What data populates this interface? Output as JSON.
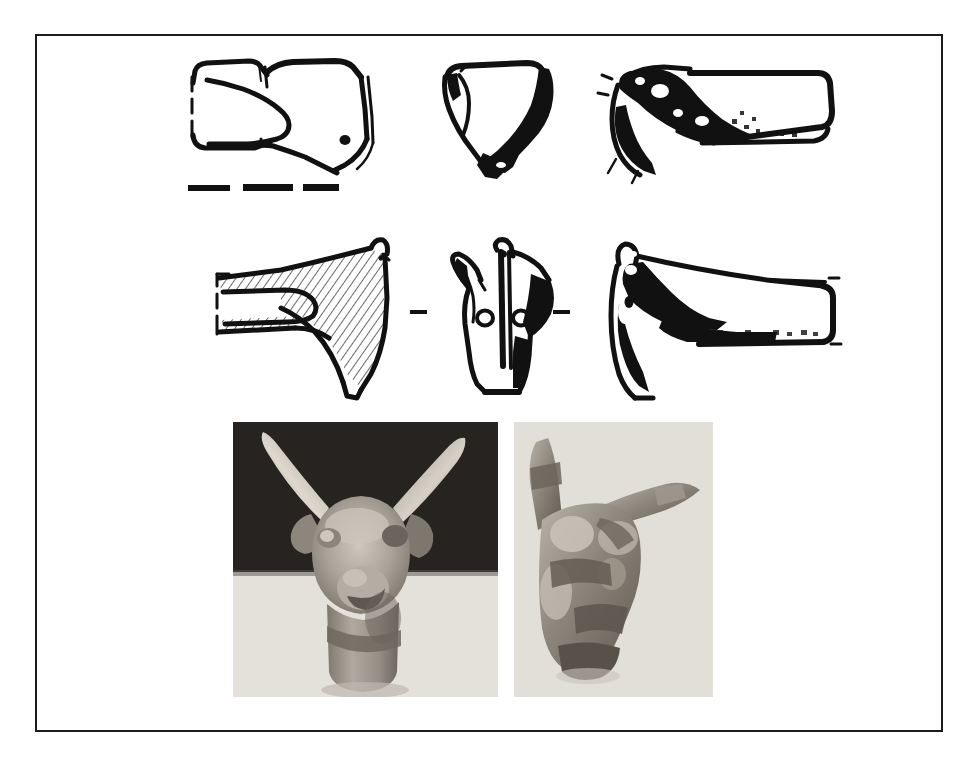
{
  "figure": {
    "title": "Archaeological plate: animal-head (bovid) terminal, line drawings and photographs",
    "frame": {
      "border_color": "#1b1b1b",
      "background_color": "#ffffff",
      "x": 35,
      "y": 34,
      "width": 908,
      "height": 698
    },
    "colors": {
      "ink": "#111111",
      "paper": "#ffffff",
      "photo_background_dark": "#2a2724",
      "photo_background_light": "#e3e0da",
      "photo_object_mid": "#9b948a",
      "photo_object_light": "#c8c2b8",
      "photo_object_dark": "#6a645c"
    },
    "rows": [
      {
        "name": "top-row-line-drawings",
        "description": "Three inked views of the object: left profile (socketed shaft with muzzle), frontal view, right profile",
        "items": [
          {
            "name": "drawing-top-left",
            "view": "left-profile-outline",
            "x": 183,
            "y": 45,
            "width": 220,
            "height": 125
          },
          {
            "name": "drawing-top-middle",
            "view": "frontal-head",
            "x": 440,
            "y": 45,
            "width": 130,
            "height": 125
          },
          {
            "name": "drawing-top-right",
            "view": "right-profile-shaded",
            "x": 580,
            "y": 45,
            "width": 235,
            "height": 125
          }
        ],
        "scale_bar": {
          "name": "scale-bar",
          "segments": 3,
          "x": 186,
          "y": 182,
          "width": 150,
          "height": 7
        }
      },
      {
        "name": "second-row-line-drawings",
        "description": "Three inked views of a second, larger socketed animal-head terminal with horns and rivet holes",
        "items": [
          {
            "name": "drawing-bottom-left",
            "view": "left-profile-hatched-socket",
            "x": 186,
            "y": 230,
            "width": 240,
            "height": 160
          },
          {
            "name": "drawing-bottom-middle",
            "view": "frontal-head-rivets",
            "x": 437,
            "y": 228,
            "width": 120,
            "height": 160
          },
          {
            "name": "drawing-bottom-right",
            "view": "right-profile-filled",
            "x": 565,
            "y": 228,
            "width": 250,
            "height": 160
          }
        ],
        "tick_dashes": [
          {
            "name": "centre-dash-left",
            "x": 410,
            "y": 310,
            "width": 17,
            "height": 4
          },
          {
            "name": "centre-dash-right",
            "x": 552,
            "y": 310,
            "width": 17,
            "height": 4
          }
        ]
      },
      {
        "name": "photograph-row",
        "description": "Two monochrome photographs of the cast animal-head figurine",
        "items": [
          {
            "name": "photo-front-view",
            "view": "frontal",
            "subject": "animal head with two upswept horns, eyes and muzzle, on neck socket",
            "x": 232,
            "y": 422,
            "width": 265,
            "height": 275,
            "background_split": "dark upper band, light lower band"
          },
          {
            "name": "photo-oblique-view",
            "view": "three-quarter-from-above",
            "subject": "same head seen obliquely, both horns projecting",
            "x": 513,
            "y": 422,
            "width": 199,
            "height": 275,
            "background_split": "uniform light"
          }
        ]
      }
    ]
  }
}
